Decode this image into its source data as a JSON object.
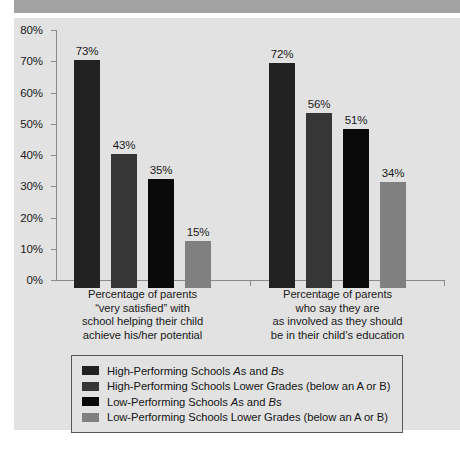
{
  "chart_data": {
    "type": "bar",
    "title": "",
    "subtitle": "",
    "xlabel": "",
    "ylabel": "",
    "ylim": [
      0,
      80
    ],
    "grid": false,
    "legend_position": "bottom",
    "y_ticks": [
      "0%",
      "10%",
      "20%",
      "30%",
      "40%",
      "50%",
      "60%",
      "70%",
      "80%"
    ],
    "y_tick_values": [
      0,
      10,
      20,
      30,
      40,
      50,
      60,
      70,
      80
    ],
    "categories": [
      "Percentage of parents “very satisfied” with school helping their child achieve his/her potential",
      "Percentage of parents who say they are as involved as they should be in their child’s education"
    ],
    "category_lines": [
      [
        "Percentage of parents",
        "“very satisfied” with",
        "school helping their child",
        "achieve his/her potential"
      ],
      [
        "Percentage of parents",
        "who say they are",
        "as involved as they should",
        "be in their child’s education"
      ]
    ],
    "series": [
      {
        "name": "High-Performing Schools As and Bs",
        "color": "#222222",
        "values": [
          73,
          72
        ],
        "labels": [
          "73%",
          "72%"
        ]
      },
      {
        "name": "High-Performing Schools Lower Grades (below an A or B)",
        "color": "#363636",
        "values": [
          43,
          56
        ],
        "labels": [
          "43%",
          "56%"
        ]
      },
      {
        "name": "Low-Performing Schools As and Bs",
        "color": "#0a0a0a",
        "values": [
          35,
          51
        ],
        "labels": [
          "35%",
          "51%"
        ]
      },
      {
        "name": "Low-Performing Schools Lower Grades (below an A or B)",
        "color": "#808080",
        "values": [
          15,
          34
        ],
        "labels": [
          "15%",
          "34%"
        ]
      }
    ]
  },
  "legend": {
    "items": [
      {
        "prefix": "High-Performing Schools ",
        "a": "A",
        "mid": "s and ",
        "b": "B",
        "suffix": "s",
        "color": "#222222"
      },
      {
        "prefix": "High-Performing Schools Lower Grades (below an A or B)",
        "a": "",
        "mid": "",
        "b": "",
        "suffix": "",
        "color": "#363636"
      },
      {
        "prefix": "Low-Performing Schools ",
        "a": "A",
        "mid": "s and ",
        "b": "B",
        "suffix": "s",
        "color": "#0a0a0a"
      },
      {
        "prefix": "Low-Performing Schools Lower Grades (below an A or B)",
        "a": "",
        "mid": "",
        "b": "",
        "suffix": "",
        "color": "#808080"
      }
    ]
  },
  "colors": {
    "header_band": "#a2a2a2",
    "panel_background": "#e2e2e2",
    "axis": "#8a8a8a",
    "text": "#1a1a1a",
    "legend_border": "#55555a"
  }
}
